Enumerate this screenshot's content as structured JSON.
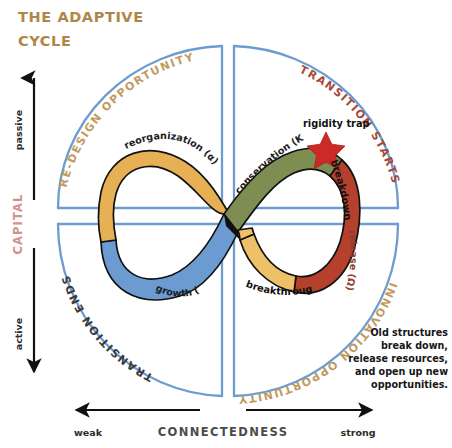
{
  "title": {
    "line1": "THE ADAPTIVE",
    "line2": "CYCLE",
    "color": "#b08548"
  },
  "axes": {
    "vertical": {
      "label": "CAPITAL",
      "top_end": "passive",
      "bottom_end": "active",
      "label_color": "#d4908c"
    },
    "horizontal": {
      "label": "CONNECTEDNESS",
      "left_end": "weak",
      "right_end": "strong",
      "label_color": "#4b4b4b"
    }
  },
  "quadrant_arcs": [
    {
      "id": "top-left",
      "label": "RE-DESIGN OPPORTUNITY",
      "color": "#c39a5e"
    },
    {
      "id": "top-right",
      "label": "TRANSITION STARTS",
      "color": "#a5493d"
    },
    {
      "id": "bottom-left",
      "label": "TRANSITION ENDS",
      "color": "#3a3a3a"
    },
    {
      "id": "bottom-right",
      "label": "INNOVATION OPPORTUNITY",
      "color": "#c39a5e"
    }
  ],
  "loop_phases": [
    {
      "id": "reorganization",
      "label": "reorganization (α)",
      "color": "#e8b055",
      "text_color": "#1c1c1c"
    },
    {
      "id": "conservation",
      "label": "conservation (K)",
      "color": "#7e8e52",
      "text_color": "#1c1c1c"
    },
    {
      "id": "release",
      "label": "release (Ω)",
      "color": "#b5412c",
      "text_color": "#8e3b2e"
    },
    {
      "id": "growth",
      "label": "growth (r)",
      "color": "#6b9bd1",
      "text_color": "#1c1c1c"
    }
  ],
  "events": [
    {
      "id": "rigidity-trap",
      "label": "rigidity trap"
    },
    {
      "id": "breakdown",
      "label": "breakdown"
    },
    {
      "id": "breakthrough",
      "label": "breakthrough"
    }
  ],
  "star": {
    "name": "rigidity-trap-star",
    "color": "#cc2a26"
  },
  "note": {
    "lines": [
      "Old structures",
      "break down,",
      "release resources,",
      "and open up new",
      "opportunities."
    ]
  },
  "frame": {
    "color": "#6d9dd0"
  }
}
